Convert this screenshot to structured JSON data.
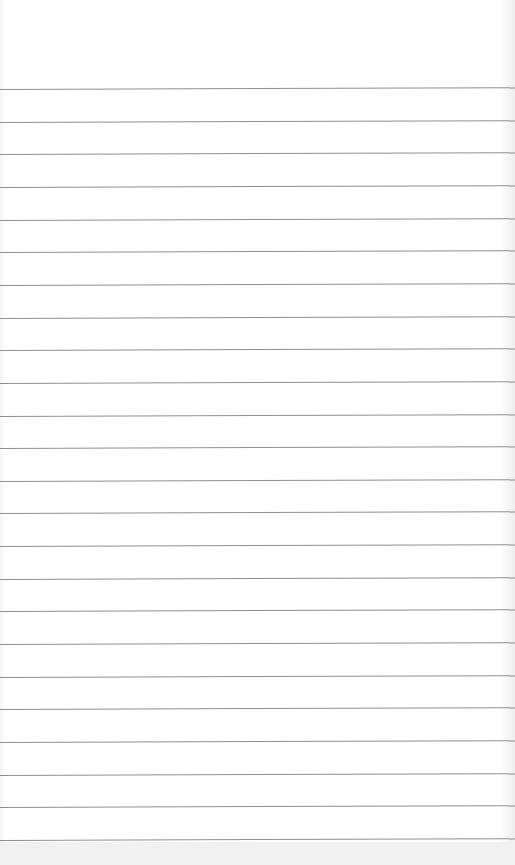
{
  "page": {
    "type": "lined-paper",
    "background_color": "#ffffff",
    "line_color": "#8f8f8f",
    "line_count": 24,
    "first_line_y": 89,
    "line_spacing": 32.65
  }
}
